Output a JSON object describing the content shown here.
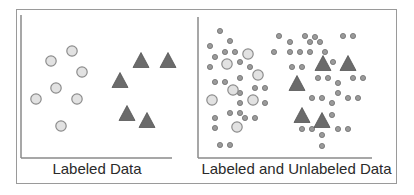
{
  "figure": {
    "panels": [
      {
        "id": "labeled",
        "caption": "Labeled Data",
        "axes": {
          "x0": 21,
          "y_top": 15,
          "y_base": 158,
          "x_end": 172
        },
        "labeled_circles": [
          [
            72,
            51
          ],
          [
            51,
            61
          ],
          [
            82,
            72
          ],
          [
            56,
            88
          ],
          [
            36,
            99
          ],
          [
            77,
            99
          ],
          [
            61,
            126
          ]
        ],
        "labeled_triangles": [
          [
            141,
            60
          ],
          [
            168,
            60
          ],
          [
            120,
            80
          ],
          [
            127,
            113
          ],
          [
            147,
            120
          ]
        ],
        "unlabeled_points": []
      },
      {
        "id": "labeled-and-unlabeled",
        "caption": "Labeled and Unlabeled Data",
        "axes": {
          "x0": 198,
          "y_top": 17,
          "y_base": 158,
          "x_end": 372
        },
        "labeled_circles": [
          [
            248,
            54
          ],
          [
            227,
            64
          ],
          [
            258,
            75
          ],
          [
            233,
            90
          ],
          [
            212,
            100
          ],
          [
            253,
            100
          ],
          [
            237,
            127
          ]
        ],
        "labeled_triangles": [
          [
            323,
            63
          ],
          [
            348,
            63
          ],
          [
            297,
            83
          ],
          [
            302,
            115
          ],
          [
            322,
            120
          ]
        ],
        "unlabeled_points": [
          [
            220,
            31
          ],
          [
            230,
            41
          ],
          [
            210,
            46
          ],
          [
            225,
            52
          ],
          [
            235,
            52
          ],
          [
            215,
            57
          ],
          [
            240,
            62
          ],
          [
            210,
            67
          ],
          [
            250,
            67
          ],
          [
            240,
            78
          ],
          [
            215,
            82
          ],
          [
            225,
            82
          ],
          [
            255,
            88
          ],
          [
            265,
            88
          ],
          [
            240,
            93
          ],
          [
            240,
            103
          ],
          [
            265,
            103
          ],
          [
            230,
            113
          ],
          [
            240,
            113
          ],
          [
            245,
            118
          ],
          [
            255,
            118
          ],
          [
            215,
            118
          ],
          [
            215,
            128
          ],
          [
            220,
            145
          ],
          [
            230,
            145
          ],
          [
            279,
            36
          ],
          [
            290,
            42
          ],
          [
            305,
            36
          ],
          [
            310,
            42
          ],
          [
            315,
            37
          ],
          [
            320,
            42
          ],
          [
            343,
            36
          ],
          [
            353,
            36
          ],
          [
            274,
            52
          ],
          [
            290,
            52
          ],
          [
            300,
            52
          ],
          [
            310,
            52
          ],
          [
            325,
            52
          ],
          [
            333,
            62
          ],
          [
            292,
            67
          ],
          [
            302,
            67
          ],
          [
            318,
            78
          ],
          [
            328,
            78
          ],
          [
            338,
            83
          ],
          [
            353,
            78
          ],
          [
            363,
            78
          ],
          [
            338,
            93
          ],
          [
            312,
            98
          ],
          [
            322,
            98
          ],
          [
            332,
            103
          ],
          [
            348,
            98
          ],
          [
            358,
            98
          ],
          [
            332,
            115
          ],
          [
            302,
            129
          ],
          [
            312,
            129
          ],
          [
            322,
            135
          ],
          [
            338,
            129
          ],
          [
            348,
            129
          ],
          [
            322,
            146
          ]
        ]
      }
    ],
    "legend_semantics": {
      "circle": "class A (labeled)",
      "triangle": "class B (labeled)",
      "small-dot": "unlabeled sample"
    },
    "colors": {
      "frame": "#9a9a9a",
      "axis": "#8a8a8a",
      "circle_fill": "#e2e2e2",
      "circle_stroke": "#8c8c8c",
      "triangle_fill": "#6b6b6b",
      "triangle_stroke": "#555555",
      "dot_fill": "#9a9a9a",
      "dot_stroke": "#6e6e6e",
      "text": "#2a2a2a"
    }
  }
}
